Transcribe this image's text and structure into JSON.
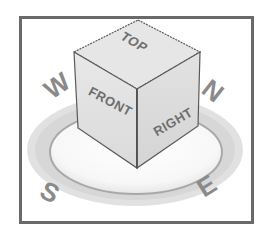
{
  "viewcube": {
    "faces": {
      "top": "TOP",
      "front": "FRONT",
      "right": "RIGHT"
    },
    "compass": {
      "north": "N",
      "south": "S",
      "east": "E",
      "west": "W"
    },
    "colors": {
      "frame": "#6a6a6a",
      "cube_face": "#e4e4e4",
      "cube_edge": "#5a5a5a",
      "label": "#6e6e6e",
      "ring": "#d2d2d2",
      "compass_letter": "#8a8a8a"
    }
  }
}
